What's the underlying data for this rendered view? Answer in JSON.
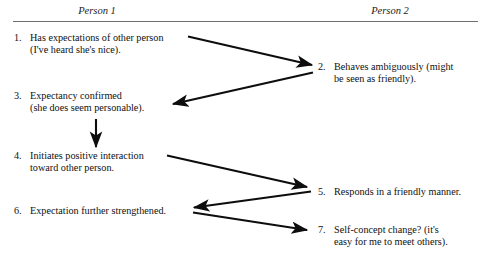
{
  "diagram": {
    "title_columns": {
      "person1": "Person 1",
      "person2": "Person 2"
    },
    "steps": [
      {
        "number": "1.",
        "column": "person1",
        "lines": [
          "Has expectations of other person",
          "(I've heard she's nice)."
        ]
      },
      {
        "number": "2.",
        "column": "person2",
        "lines": [
          "Behaves ambiguously (might",
          "be seen as friendly)."
        ]
      },
      {
        "number": "3.",
        "column": "person1",
        "lines": [
          "Expectancy confirmed",
          "(she does seem personable)."
        ]
      },
      {
        "number": "4.",
        "column": "person1",
        "lines": [
          "Initiates positive interaction",
          "toward other person."
        ]
      },
      {
        "number": "5.",
        "column": "person2",
        "lines": [
          "Responds in a friendly manner."
        ]
      },
      {
        "number": "6.",
        "column": "person1",
        "lines": [
          "Expectation further strengthened."
        ]
      },
      {
        "number": "7.",
        "column": "person2",
        "lines": [
          "Self-concept change? (it's",
          "easy for me to meet others)."
        ]
      }
    ],
    "arrows": [
      {
        "id": "arrow-1-to-2",
        "from_step": "1",
        "to_step": "2",
        "direction": "down-right"
      },
      {
        "id": "arrow-2-to-3",
        "from_step": "2",
        "to_step": "3",
        "direction": "down-left"
      },
      {
        "id": "arrow-3-to-4",
        "from_step": "3",
        "to_step": "4",
        "direction": "down"
      },
      {
        "id": "arrow-4-to-5",
        "from_step": "4",
        "to_step": "5",
        "direction": "down-right"
      },
      {
        "id": "arrow-5-to-6",
        "from_step": "5",
        "to_step": "6",
        "direction": "down-left"
      },
      {
        "id": "arrow-6-to-7",
        "from_step": "6",
        "to_step": "7",
        "direction": "down-right"
      }
    ],
    "colors": {
      "text": "#101010",
      "rule": "#6f6f6f",
      "arrow": "#0d0d0d",
      "background": "#ffffff"
    }
  }
}
